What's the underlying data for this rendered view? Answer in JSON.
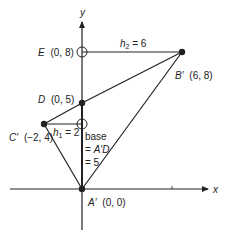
{
  "axes": {
    "x_label": "x",
    "y_label": "y"
  },
  "points": {
    "A": {
      "label": "A′",
      "coords": "(0, 0)"
    },
    "B": {
      "label": "B′",
      "coords": "(6, 8)"
    },
    "C": {
      "label": "C′",
      "coords": "(−2, 4)"
    },
    "D": {
      "label": "D",
      "coords": "(0, 5)"
    },
    "E": {
      "label": "E",
      "coords": "(0, 8)"
    }
  },
  "heights": {
    "h1": {
      "var": "h",
      "sub": "1",
      "value": " = 2"
    },
    "h2": {
      "var": "h",
      "sub": "2",
      "value": " = 6"
    }
  },
  "base": {
    "line1": "base",
    "line2_eq": "= ",
    "line2_val": "A′D",
    "line3": "=  5"
  },
  "colors": {
    "line": "#222222",
    "background": "#ffffff"
  }
}
